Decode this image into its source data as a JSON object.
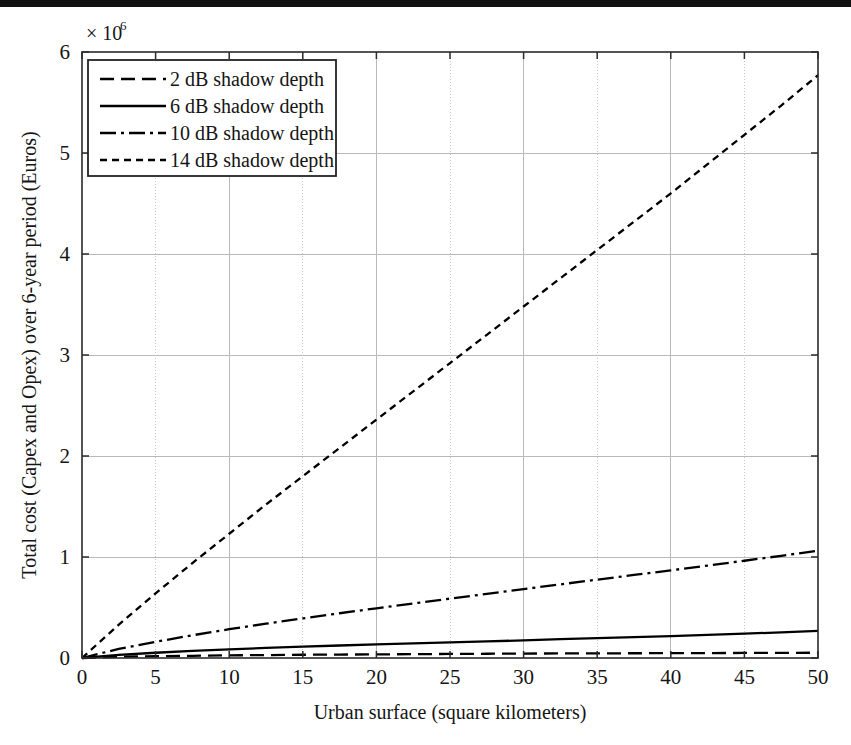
{
  "figure": {
    "background_color": "#ffffff",
    "ink_color": "#000000",
    "grid_color": "#b9b9b9",
    "bottom_rule": {
      "name": "bottom-rule",
      "y": 719,
      "height": 7,
      "color": "#111111"
    }
  },
  "chart_data": {
    "type": "line",
    "title": "",
    "subtitle": "",
    "xlabel": "Urban surface (square kilometers)",
    "ylabel": "Total cost (Capex and Opex) over 6-year period (Euros)",
    "y_exponent_label": "× 10",
    "y_exponent_power": "6",
    "y_scale_multiplier": 1000000,
    "xlim": [
      0,
      50
    ],
    "ylim": [
      0,
      6
    ],
    "xticks": [
      0,
      5,
      10,
      15,
      20,
      25,
      30,
      35,
      40,
      45,
      50
    ],
    "xticklabels": [
      "0",
      "5",
      "10",
      "15",
      "20",
      "25",
      "30",
      "35",
      "40",
      "45",
      "50"
    ],
    "yticks": [
      0,
      1,
      2,
      3,
      4,
      5,
      6
    ],
    "yticklabels": [
      "0",
      "1",
      "2",
      "3",
      "4",
      "5",
      "6"
    ],
    "grid": true,
    "grid_major_x": [
      10,
      20,
      30,
      40
    ],
    "grid_minor_x": [
      5,
      15,
      25,
      35,
      45
    ],
    "grid_major_y": [
      1,
      2,
      3,
      4,
      5
    ],
    "legend_position": "upper left",
    "x": [
      0,
      2.5,
      5,
      7.5,
      10,
      12.5,
      15,
      17.5,
      20,
      22.5,
      25,
      27.5,
      30,
      32.5,
      35,
      37.5,
      40,
      42.5,
      45,
      47.5,
      50
    ],
    "series": [
      {
        "name": "2 dB shadow depth",
        "label": "2 dB shadow depth",
        "style": "long-dash",
        "dasharray": "14 7",
        "color": "#000000",
        "values": [
          0,
          0.012,
          0.018,
          0.022,
          0.026,
          0.029,
          0.032,
          0.034,
          0.036,
          0.038,
          0.04,
          0.042,
          0.044,
          0.045,
          0.046,
          0.047,
          0.048,
          0.049,
          0.05,
          0.051,
          0.052
        ]
      },
      {
        "name": "6 dB shadow depth",
        "label": "6 dB shadow depth",
        "style": "solid",
        "dasharray": "none",
        "color": "#000000",
        "values": [
          0,
          0.03,
          0.052,
          0.07,
          0.086,
          0.1,
          0.113,
          0.124,
          0.134,
          0.144,
          0.154,
          0.164,
          0.175,
          0.186,
          0.196,
          0.206,
          0.216,
          0.228,
          0.241,
          0.254,
          0.268
        ]
      },
      {
        "name": "10 dB shadow depth",
        "label": "10 dB shadow depth",
        "style": "dash-dot",
        "dasharray": "16 5 3 5",
        "color": "#000000",
        "values": [
          0,
          0.09,
          0.16,
          0.225,
          0.285,
          0.34,
          0.392,
          0.443,
          0.492,
          0.54,
          0.588,
          0.635,
          0.682,
          0.729,
          0.776,
          0.822,
          0.868,
          0.915,
          0.963,
          1.012,
          1.062
        ]
      },
      {
        "name": "14 dB shadow depth",
        "label": "14 dB shadow depth",
        "style": "short-dash",
        "dasharray": "7 5",
        "color": "#000000",
        "values": [
          0,
          0.33,
          0.64,
          0.94,
          1.23,
          1.52,
          1.8,
          2.08,
          2.36,
          2.64,
          2.92,
          3.2,
          3.48,
          3.76,
          4.04,
          4.32,
          4.6,
          4.89,
          5.18,
          5.47,
          5.77
        ]
      }
    ]
  },
  "legend": {
    "name": "chart-legend",
    "items": [
      {
        "label": "2 dB shadow depth",
        "dasharray": "14 7"
      },
      {
        "label": "6 dB shadow depth",
        "dasharray": "none"
      },
      {
        "label": "10 dB shadow depth",
        "dasharray": "16 5 3 5"
      },
      {
        "label": "14 dB shadow depth",
        "dasharray": "7 5"
      }
    ]
  }
}
